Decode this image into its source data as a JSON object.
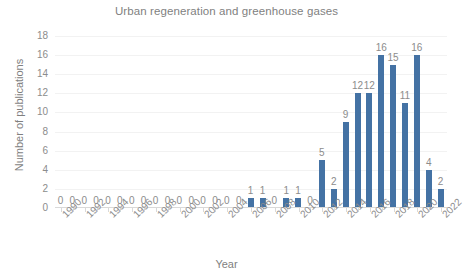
{
  "chart_data": {
    "type": "bar",
    "title": "Urban regeneration and greenhouse gases",
    "xlabel": "Year",
    "ylabel": "Number of publications",
    "ylim": [
      0,
      18
    ],
    "yticks": [
      0,
      2,
      4,
      6,
      8,
      10,
      12,
      14,
      16,
      18
    ],
    "grid": true,
    "legend": "none",
    "bar_color": "#4472a4",
    "data_labels": true,
    "categories": [
      "1990",
      "1991",
      "1992",
      "1993",
      "1994",
      "1995",
      "1996",
      "1997",
      "1998",
      "1999",
      "2000",
      "2001",
      "2002",
      "2003",
      "2004",
      "2005",
      "2006",
      "2007",
      "2008",
      "2009",
      "2010",
      "2011",
      "2012",
      "2013",
      "2014",
      "2015",
      "2016",
      "2017",
      "2018",
      "2019",
      "2020",
      "2021",
      "2022"
    ],
    "values": [
      0,
      0,
      0,
      0,
      0,
      0,
      0,
      0,
      0,
      0,
      0,
      0,
      0,
      0,
      0,
      0,
      1,
      1,
      0,
      1,
      1,
      0,
      5,
      2,
      9,
      12,
      12,
      16,
      15,
      11,
      16,
      4,
      2
    ],
    "xtick_labels": [
      "1990",
      "1992",
      "1994",
      "1996",
      "1998",
      "2000",
      "2002",
      "2004",
      "2006",
      "2008",
      "2010",
      "2012",
      "2014",
      "2016",
      "2018",
      "2020",
      "2022"
    ]
  }
}
